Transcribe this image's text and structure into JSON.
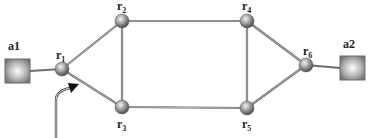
{
  "diagram": {
    "type": "network-topology",
    "hosts": [
      {
        "id": "a1",
        "label": "a1"
      },
      {
        "id": "a2",
        "label": "a2"
      }
    ],
    "routers": [
      {
        "id": "r1",
        "label": "r",
        "sub": "1"
      },
      {
        "id": "r2",
        "label": "r",
        "sub": "2"
      },
      {
        "id": "r3",
        "label": "r",
        "sub": "3"
      },
      {
        "id": "r4",
        "label": "r",
        "sub": "4"
      },
      {
        "id": "r5",
        "label": "r",
        "sub": "5"
      },
      {
        "id": "r6",
        "label": "r",
        "sub": "6"
      }
    ],
    "links": [
      [
        "a1",
        "r1"
      ],
      [
        "r1",
        "r2"
      ],
      [
        "r1",
        "r3"
      ],
      [
        "r2",
        "r3"
      ],
      [
        "r2",
        "r4"
      ],
      [
        "r3",
        "r5"
      ],
      [
        "r4",
        "r5"
      ],
      [
        "r4",
        "r6"
      ],
      [
        "r5",
        "r6"
      ],
      [
        "r6",
        "a2"
      ]
    ],
    "arrow": {
      "points_to": "r1-r3 link",
      "description": "incoming arrow pointing at link between r1 and r3"
    },
    "caption": "",
    "colors": {
      "link": "#7a7a7a",
      "node_fill": "#9a9a9a",
      "host_border": "#777777",
      "host_center": "#ffffff"
    }
  }
}
